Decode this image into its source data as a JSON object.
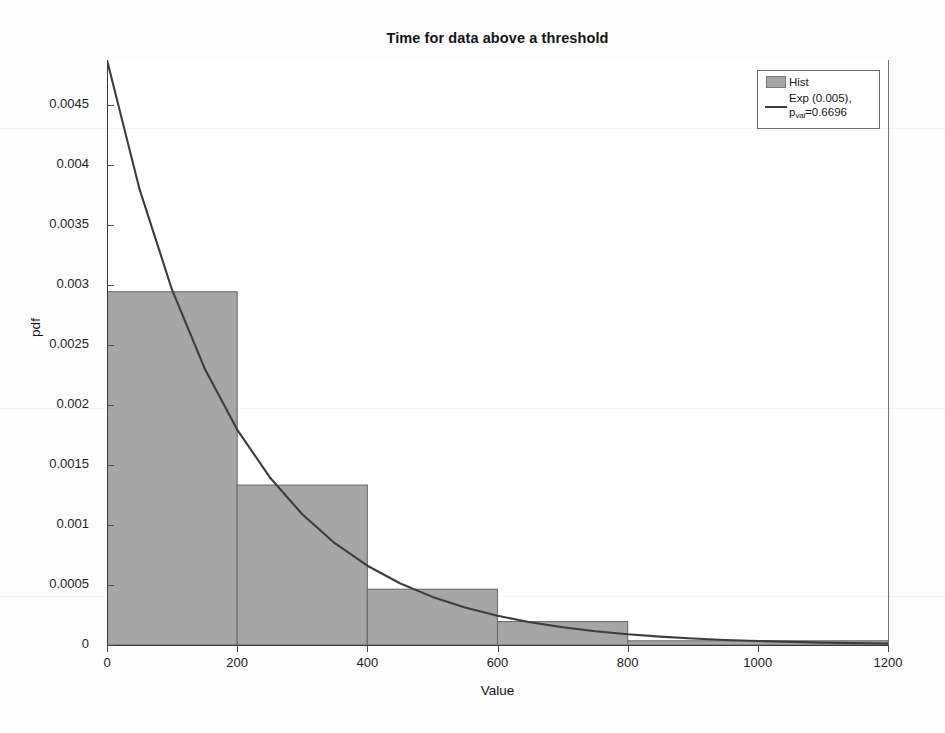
{
  "chart_data": {
    "type": "bar",
    "title": "Time for data above a threshold",
    "xlabel": "Value",
    "ylabel": "pdf",
    "xlim": [
      0,
      1200
    ],
    "ylim": [
      0,
      0.004877
    ],
    "grid": false,
    "legend_position": "upper right",
    "xticks": [
      0,
      200,
      400,
      600,
      800,
      1000,
      1200
    ],
    "xtick_labels": [
      "0",
      "200",
      "400",
      "600",
      "800",
      "1000",
      "1200"
    ],
    "yticks": [
      0,
      0.0005,
      0.001,
      0.0015,
      0.002,
      0.0025,
      0.003,
      0.0035,
      0.004,
      0.0045
    ],
    "ytick_labels": [
      "0",
      "0.0005",
      "0.001",
      "0.0015",
      "0.002",
      "0.0025",
      "0.003",
      "0.0035",
      "0.004",
      "0.0045"
    ],
    "series": [
      {
        "name": "Hist",
        "type": "histogram",
        "bin_edges": [
          0,
          200,
          400,
          600,
          800,
          1200
        ],
        "values": [
          0.002945,
          0.001333,
          0.000465,
          0.000195,
          3.5e-05
        ],
        "face_color": "#a6a6a6",
        "edge_color": "#6b6b6b"
      },
      {
        "name": "Exp (0.005), p_val=0.6696",
        "type": "line",
        "rate": 0.005,
        "p_val": 0.6696,
        "color": "#3d3d3d",
        "x": [
          0,
          50,
          100,
          150,
          200,
          250,
          300,
          350,
          400,
          450,
          500,
          550,
          600,
          650,
          700,
          750,
          800,
          850,
          900,
          950,
          1000,
          1050,
          1100,
          1150,
          1200
        ],
        "y": [
          0.004877,
          0.0038,
          0.00296,
          0.002306,
          0.001796,
          0.001399,
          0.00109,
          0.000849,
          0.000661,
          0.000515,
          0.000401,
          0.000313,
          0.000244,
          0.00019,
          0.000148,
          0.000115,
          8.9e-05,
          7e-05,
          5.4e-05,
          4.2e-05,
          3.3e-05,
          2.6e-05,
          2e-05,
          1.6e-05,
          1.2e-05
        ]
      }
    ]
  },
  "legend": {
    "entries": [
      {
        "label": "Hist",
        "key": "patch"
      },
      {
        "label_line1": "Exp (0.005),",
        "label_line2_prefix": "p",
        "label_line2_sub": "val",
        "label_line2_suffix": "=0.6696",
        "key": "line"
      }
    ]
  }
}
